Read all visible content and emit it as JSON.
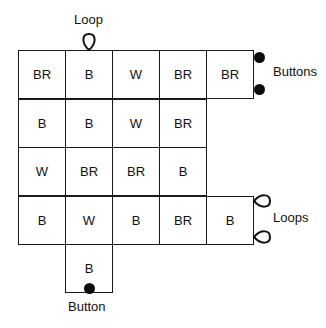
{
  "diagram": {
    "type": "quilt-block-layout",
    "grid": {
      "rows": [
        {
          "cells": [
            {
              "row": 0,
              "col": 0,
              "text": "BR"
            },
            {
              "row": 0,
              "col": 1,
              "text": "B"
            },
            {
              "row": 0,
              "col": 2,
              "text": "W"
            },
            {
              "row": 0,
              "col": 3,
              "text": "BR"
            },
            {
              "row": 0,
              "col": 4,
              "text": "BR"
            }
          ]
        },
        {
          "cells": [
            {
              "row": 1,
              "col": 0,
              "text": "B"
            },
            {
              "row": 1,
              "col": 1,
              "text": "B"
            },
            {
              "row": 1,
              "col": 2,
              "text": "W"
            },
            {
              "row": 1,
              "col": 3,
              "text": "BR"
            }
          ]
        },
        {
          "cells": [
            {
              "row": 2,
              "col": 0,
              "text": "W"
            },
            {
              "row": 2,
              "col": 1,
              "text": "BR"
            },
            {
              "row": 2,
              "col": 2,
              "text": "BR"
            },
            {
              "row": 2,
              "col": 3,
              "text": "B"
            }
          ]
        },
        {
          "cells": [
            {
              "row": 3,
              "col": 0,
              "text": "B"
            },
            {
              "row": 3,
              "col": 1,
              "text": "W"
            },
            {
              "row": 3,
              "col": 2,
              "text": "B"
            },
            {
              "row": 3,
              "col": 3,
              "text": "BR"
            },
            {
              "row": 3,
              "col": 4,
              "text": "B"
            }
          ]
        },
        {
          "cells": [
            {
              "row": 4,
              "col": 1,
              "text": "B"
            }
          ]
        }
      ]
    },
    "annotations": {
      "loop_top": "Loop",
      "buttons_right": "Buttons",
      "loops_right": "Loops",
      "button_bottom": "Button"
    },
    "colors": {
      "line": "#1a1a1a",
      "fill": "#ffffff",
      "marker": "#0d0d0d"
    }
  }
}
